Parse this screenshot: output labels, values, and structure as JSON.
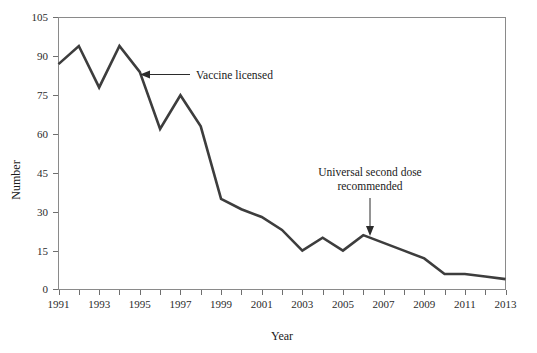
{
  "chart_data": {
    "type": "line",
    "title": "",
    "xlabel": "Year",
    "ylabel": "Number",
    "xlim": [
      1991,
      2013
    ],
    "ylim": [
      0,
      105
    ],
    "grid": false,
    "legend": "none",
    "x_tick_labels": [
      "1991",
      "1993",
      "1995",
      "1997",
      "1999",
      "2001",
      "2003",
      "2005",
      "2007",
      "2009",
      "2011",
      "2013"
    ],
    "x_tick_values": [
      1991,
      1993,
      1995,
      1997,
      1999,
      2001,
      2003,
      2005,
      2007,
      2009,
      2011,
      2013
    ],
    "y_tick_labels": [
      "0",
      "15",
      "30",
      "45",
      "60",
      "75",
      "90",
      "105"
    ],
    "y_tick_values": [
      0,
      15,
      30,
      45,
      60,
      75,
      90,
      105
    ],
    "x": [
      1991,
      1992,
      1993,
      1994,
      1995,
      1996,
      1997,
      1998,
      1999,
      2000,
      2001,
      2002,
      2003,
      2004,
      2005,
      2006,
      2007,
      2008,
      2009,
      2010,
      2011,
      2012,
      2013
    ],
    "values": [
      87,
      94,
      78,
      94,
      84,
      62,
      75,
      63,
      35,
      31,
      28,
      23,
      15,
      20,
      15,
      21,
      18,
      15,
      12,
      6,
      6,
      5,
      4
    ],
    "series": [
      {
        "name": "Number",
        "values": [
          87,
          94,
          78,
          94,
          84,
          62,
          75,
          63,
          35,
          31,
          28,
          23,
          15,
          20,
          15,
          21,
          18,
          15,
          12,
          6,
          6,
          5,
          4
        ]
      }
    ],
    "annotations": [
      {
        "id": "vaccine-licensed",
        "label": "Vaccine licensed",
        "target_x": 1995,
        "target_y": 84,
        "arrow": "left"
      },
      {
        "id": "universal-second-dose",
        "label_line1": "Universal second dose",
        "label_line2": "recommended",
        "target_x": 2006,
        "target_y": 21,
        "arrow": "down"
      }
    ],
    "colors": {
      "line": "#3d3d3d",
      "frame": "#8a8a8a",
      "text": "#1a1a1a",
      "background": "#ffffff"
    }
  }
}
